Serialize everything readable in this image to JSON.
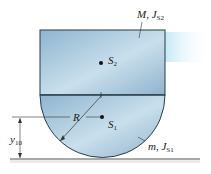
{
  "diagram": {
    "type": "mechanics-free-body",
    "labels": {
      "upper_body": {
        "mass": "M",
        "inertia": "J",
        "inertia_sub": "S2"
      },
      "lower_body": {
        "mass": "m",
        "inertia": "J",
        "inertia_sub": "S1"
      },
      "center_upper": {
        "name": "S",
        "sub": "2"
      },
      "center_lower": {
        "name": "S",
        "sub": "1"
      },
      "radius": "R",
      "height": {
        "name": "y",
        "sub": "10"
      }
    },
    "colors": {
      "body_fill": "#9cc0d8",
      "body_light": "#d7e8f2",
      "outline": "#2b3a48",
      "ground": "#555555"
    }
  }
}
